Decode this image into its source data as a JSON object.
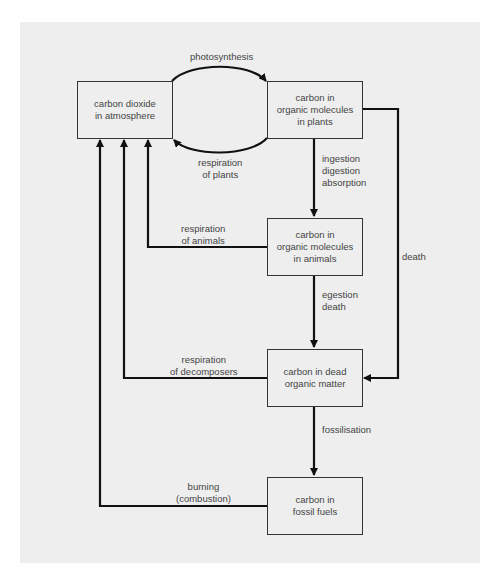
{
  "diagram": {
    "type": "flowchart",
    "nodes": [
      {
        "id": "co2",
        "lines": [
          "carbon dioxide",
          "in atmosphere"
        ]
      },
      {
        "id": "plants",
        "lines": [
          "carbon in",
          "organic molecules",
          "in plants"
        ]
      },
      {
        "id": "animals",
        "lines": [
          "carbon in",
          "organic molecules",
          "in animals"
        ]
      },
      {
        "id": "dead",
        "lines": [
          "carbon in dead",
          "organic matter"
        ]
      },
      {
        "id": "fossil",
        "lines": [
          "carbon in",
          "fossil fuels"
        ]
      }
    ],
    "edges": [
      {
        "from": "co2",
        "to": "plants",
        "lines": [
          "photosynthesis"
        ]
      },
      {
        "from": "plants",
        "to": "co2",
        "lines": [
          "respiration",
          "of plants"
        ]
      },
      {
        "from": "plants",
        "to": "animals",
        "lines": [
          "ingestion",
          "digestion",
          "absorption"
        ]
      },
      {
        "from": "plants",
        "to": "dead",
        "lines": [
          "death"
        ]
      },
      {
        "from": "animals",
        "to": "co2",
        "lines": [
          "respiration",
          "of animals"
        ]
      },
      {
        "from": "animals",
        "to": "dead",
        "lines": [
          "egestion",
          "death"
        ]
      },
      {
        "from": "dead",
        "to": "co2",
        "lines": [
          "respiration",
          "of decomposers"
        ]
      },
      {
        "from": "dead",
        "to": "fossil",
        "lines": [
          "fossilisation"
        ]
      },
      {
        "from": "fossil",
        "to": "co2",
        "lines": [
          "burning",
          "(combustion)"
        ]
      }
    ]
  }
}
